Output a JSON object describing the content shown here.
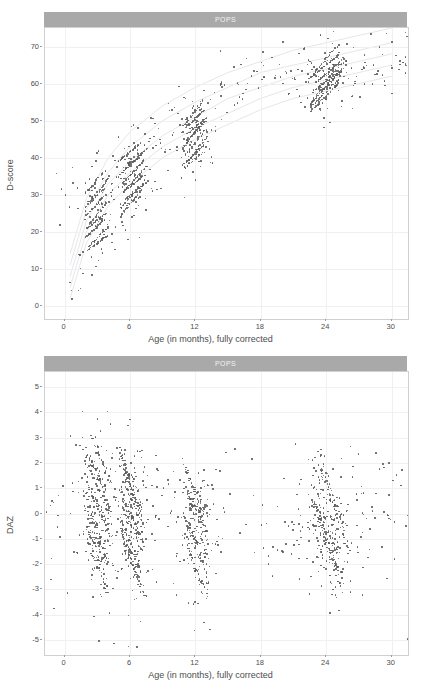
{
  "chart_data": [
    {
      "type": "scatter",
      "id": "dscore-vs-age",
      "title": "POPS",
      "xlabel": "Age (in months), fully corrected",
      "ylabel": "D-score",
      "xlim": [
        -1.8,
        31.5
      ],
      "ylim": [
        -3.5,
        75.0
      ],
      "xticks": [
        0,
        6,
        12,
        18,
        24,
        30
      ],
      "yticks": [
        0,
        10,
        20,
        30,
        40,
        50,
        60,
        70
      ],
      "xtick_labels": [
        "0",
        "6",
        "12",
        "18",
        "24",
        "30"
      ],
      "ytick_labels": [
        "0",
        "10",
        "20",
        "30",
        "40",
        "50",
        "60",
        "70"
      ],
      "grid": true,
      "legend": "none",
      "point_color": "#5a5a5a",
      "reference_curve_color": "#e3e3e8",
      "strip_bg": "#a9a9a9",
      "strip_fg": "#f2f2f2",
      "description": "D-score rises steeply from ~15 at 1 month to ~45 at 12 months then plateaus near 62-68 by 24-30 months; dense measurement clusters at 3, 6, 12 and 24 months.",
      "reference_curves": [
        {
          "name": "-2SD",
          "points": [
            [
              0.5,
              2
            ],
            [
              2,
              17
            ],
            [
              4,
              27
            ],
            [
              6,
              33
            ],
            [
              9,
              40
            ],
            [
              12,
              45
            ],
            [
              15,
              49
            ],
            [
              18,
              53
            ],
            [
              21,
              56
            ],
            [
              24,
              58
            ],
            [
              27,
              60
            ],
            [
              30,
              62
            ]
          ]
        },
        {
          "name": "-1SD",
          "points": [
            [
              0.5,
              5
            ],
            [
              2,
              20
            ],
            [
              4,
              30
            ],
            [
              6,
              36
            ],
            [
              9,
              43
            ],
            [
              12,
              48
            ],
            [
              15,
              52
            ],
            [
              18,
              56
            ],
            [
              21,
              59
            ],
            [
              24,
              61
            ],
            [
              27,
              63
            ],
            [
              30,
              65
            ]
          ]
        },
        {
          "name": "median",
          "points": [
            [
              0.5,
              8
            ],
            [
              2,
              23
            ],
            [
              4,
              33
            ],
            [
              6,
              39
            ],
            [
              9,
              46
            ],
            [
              12,
              51
            ],
            [
              15,
              56
            ],
            [
              18,
              59
            ],
            [
              21,
              62
            ],
            [
              24,
              64
            ],
            [
              27,
              66
            ],
            [
              30,
              68
            ]
          ]
        },
        {
          "name": "+1SD",
          "points": [
            [
              0.5,
              11
            ],
            [
              2,
              26
            ],
            [
              4,
              36
            ],
            [
              6,
              43
            ],
            [
              9,
              50
            ],
            [
              12,
              55
            ],
            [
              15,
              59
            ],
            [
              18,
              63
            ],
            [
              21,
              65
            ],
            [
              24,
              67
            ],
            [
              27,
              69
            ],
            [
              30,
              71
            ]
          ]
        },
        {
          "name": "+2SD",
          "points": [
            [
              0.5,
              14
            ],
            [
              2,
              29
            ],
            [
              4,
              40
            ],
            [
              6,
              47
            ],
            [
              9,
              54
            ],
            [
              12,
              59
            ],
            [
              15,
              63
            ],
            [
              18,
              66
            ],
            [
              21,
              69
            ],
            [
              24,
              71
            ],
            [
              27,
              73
            ],
            [
              30,
              75
            ]
          ]
        }
      ],
      "clusters": [
        {
          "center_x": 2.8,
          "center_y": 25.5,
          "n": 150,
          "spread_x": 1.1,
          "spread_y": 6.0
        },
        {
          "center_x": 6.2,
          "center_y": 35.0,
          "n": 180,
          "spread_x": 1.2,
          "spread_y": 5.0
        },
        {
          "center_x": 11.9,
          "center_y": 46.0,
          "n": 170,
          "spread_x": 1.1,
          "spread_y": 4.5
        },
        {
          "center_x": 24.2,
          "center_y": 61.5,
          "n": 200,
          "spread_x": 1.6,
          "spread_y": 3.5
        }
      ]
    },
    {
      "type": "scatter",
      "id": "daz-vs-age",
      "title": "POPS",
      "xlabel": "Age (in months), fully corrected",
      "ylabel": "DAZ",
      "xlim": [
        -1.8,
        31.5
      ],
      "ylim": [
        -5.6,
        5.6
      ],
      "xticks": [
        0,
        6,
        12,
        18,
        24,
        30
      ],
      "yticks": [
        -5,
        -4,
        -3,
        -2,
        -1,
        0,
        1,
        2,
        3,
        4,
        5
      ],
      "xtick_labels": [
        "0",
        "6",
        "12",
        "18",
        "24",
        "30"
      ],
      "ytick_labels": [
        "5",
        "4",
        "3",
        "2",
        "1",
        "0",
        "-1",
        "-2",
        "-3",
        "-4",
        "-5"
      ],
      "grid": true,
      "legend": "none",
      "point_color": "#5a5a5a",
      "strip_bg": "#a9a9a9",
      "strip_fg": "#f2f2f2",
      "description": "DAZ scattered around 0 across all ages, range roughly -5 to +5, with dense downward-sloping streaks within each measurement wave at 3, 6, 12 and 24 months.",
      "clusters": [
        {
          "center_x": 3.0,
          "center_y": 0.0,
          "n": 260,
          "spread_x": 1.1,
          "spread_y": 1.5
        },
        {
          "center_x": 6.2,
          "center_y": -0.3,
          "n": 280,
          "spread_x": 1.1,
          "spread_y": 1.4
        },
        {
          "center_x": 12.0,
          "center_y": -0.6,
          "n": 200,
          "spread_x": 1.1,
          "spread_y": 1.2
        },
        {
          "center_x": 24.3,
          "center_y": -0.5,
          "n": 230,
          "spread_x": 1.5,
          "spread_y": 1.0
        }
      ]
    }
  ]
}
